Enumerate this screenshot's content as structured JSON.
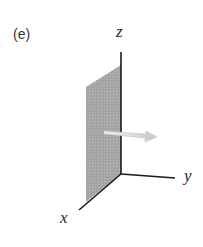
{
  "figure": {
    "panel_label": "(e)",
    "axes": {
      "x_label": "x",
      "y_label": "y",
      "z_label": "z"
    },
    "plane": {
      "description": "shaded plane in the xz-plane",
      "color": "#a9a9a9"
    },
    "vector": {
      "description": "arrow pointing in +y direction, normal to plane",
      "color": "#d8d8d8"
    },
    "axis_color": "#1a1a1a"
  }
}
